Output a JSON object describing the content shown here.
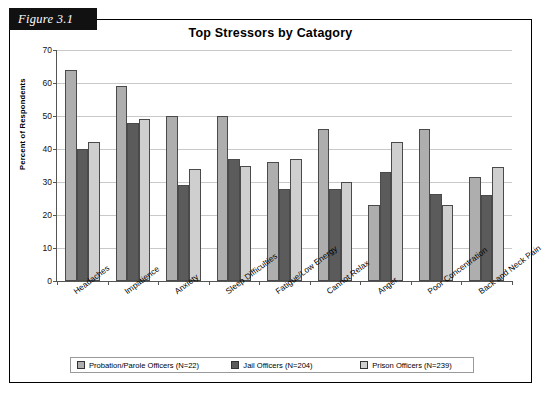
{
  "figure": {
    "tab_label": "Figure 3.1"
  },
  "chart_data": {
    "type": "bar",
    "title": "Top Stressors by Catagory",
    "xlabel": "",
    "ylabel": "Percent of Respondents",
    "ylim": [
      0,
      70
    ],
    "yticks": [
      0,
      10,
      20,
      30,
      40,
      50,
      60,
      70
    ],
    "grid": true,
    "legend_position": "bottom",
    "categories": [
      "Headaches",
      "Impatience",
      "Anxiety",
      "Sleep Difficulties",
      "Fatigue/Low Energy",
      "Cannot Relax",
      "Anger",
      "Poor Concentration",
      "Back and Neck Pain"
    ],
    "series": [
      {
        "name": "Probation/Parole Officers (N=22)",
        "color": "#aeaeae",
        "values": [
          64,
          59,
          50,
          50,
          36,
          46,
          23,
          46,
          31.5
        ]
      },
      {
        "name": "Jail Officers (N=204)",
        "color": "#5b5b5b",
        "values": [
          40,
          48,
          29,
          37,
          28,
          28,
          33,
          26.5,
          26
        ]
      },
      {
        "name": "Prison Officers (N=239)",
        "color": "#cfcfcf",
        "values": [
          42,
          49,
          34,
          35,
          37,
          30,
          42,
          23,
          34.5
        ]
      }
    ]
  }
}
